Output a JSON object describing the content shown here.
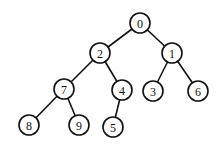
{
  "diagram": {
    "type": "binary-tree",
    "nodes": [
      {
        "id": "0",
        "label": "0",
        "x": 140,
        "y": 23
      },
      {
        "id": "2",
        "label": "2",
        "x": 100,
        "y": 53
      },
      {
        "id": "1",
        "label": "1",
        "x": 172,
        "y": 53
      },
      {
        "id": "7",
        "label": "7",
        "x": 64,
        "y": 89
      },
      {
        "id": "4",
        "label": "4",
        "x": 122,
        "y": 90
      },
      {
        "id": "3",
        "label": "3",
        "x": 153,
        "y": 91
      },
      {
        "id": "6",
        "label": "6",
        "x": 198,
        "y": 91
      },
      {
        "id": "8",
        "label": "8",
        "x": 29,
        "y": 125
      },
      {
        "id": "9",
        "label": "9",
        "x": 79,
        "y": 125
      },
      {
        "id": "5",
        "label": "5",
        "x": 113,
        "y": 127
      }
    ],
    "edges": [
      [
        "0",
        "2"
      ],
      [
        "0",
        "1"
      ],
      [
        "2",
        "7"
      ],
      [
        "2",
        "4"
      ],
      [
        "1",
        "3"
      ],
      [
        "1",
        "6"
      ],
      [
        "7",
        "8"
      ],
      [
        "7",
        "9"
      ],
      [
        "4",
        "5"
      ]
    ],
    "node_radius": 10
  }
}
